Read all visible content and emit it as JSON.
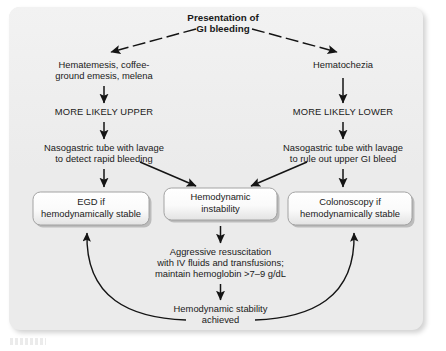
{
  "diagram": {
    "title_line1": "Presentation of",
    "title_line2": "GI bleeding",
    "left_branch": {
      "symptoms_line1": "Hematemesis, coffee-",
      "symptoms_line2": "ground emesis, melena",
      "likelihood": "MORE LIKELY UPPER",
      "ngtube_line1": "Nasogastric tube with lavage",
      "ngtube_line2": "to detect rapid bleeding",
      "outcome_line1": "EGD if",
      "outcome_line2": "hemodynamically stable"
    },
    "right_branch": {
      "symptoms_line1": "Hematochezia",
      "likelihood": "MORE LIKELY LOWER",
      "ngtube_line1": "Nasogastric tube with lavage",
      "ngtube_line2": "to rule out upper GI bleed",
      "outcome_line1": "Colonoscopy if",
      "outcome_line2": "hemodynamically stable"
    },
    "center": {
      "instability_line1": "Hemodynamic",
      "instability_line2": "instability",
      "resuscitation_line1": "Aggressive resuscitation",
      "resuscitation_line2": "with IV fluids and transfusions;",
      "resuscitation_line3": "maintain hemoglobin >7–9 g/dL",
      "stability_line1": "Hemodynamic stability",
      "stability_line2": "achieved"
    },
    "colors": {
      "panel_background": "#ebebeb",
      "page_background": "#ffffff",
      "text": "#1a1a1a",
      "connector": "#141414",
      "box_border": "#9a9a9a",
      "box_fill": "#fbfbfb"
    }
  }
}
